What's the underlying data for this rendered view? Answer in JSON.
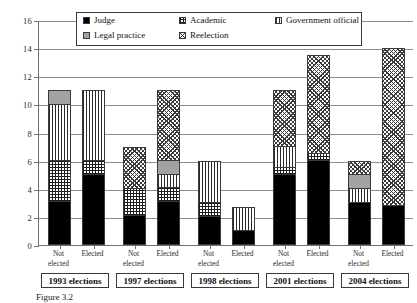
{
  "chart_data": {
    "type": "bar",
    "stacked": true,
    "title": "",
    "xlabel": "",
    "ylabel": "",
    "ylim": [
      0,
      16
    ],
    "ytick_step": 2,
    "yticks": [
      0,
      2,
      4,
      6,
      8,
      10,
      12,
      14,
      16
    ],
    "grid": true,
    "legend_position": "top-center",
    "series": [
      {
        "name": "Judge",
        "pattern": "solid-black",
        "values": [
          3,
          5,
          2,
          3,
          2,
          1,
          5,
          6,
          3,
          2.7
        ]
      },
      {
        "name": "Academic",
        "pattern": "cross-hatch-grid",
        "values": [
          3,
          1,
          2,
          1,
          1,
          0,
          0.5,
          0.5,
          0,
          0
        ]
      },
      {
        "name": "Government official",
        "pattern": "vertical-stripes",
        "values": [
          4,
          5,
          0,
          1,
          3,
          1.7,
          1.5,
          0,
          1,
          0
        ]
      },
      {
        "name": "Legal practice",
        "pattern": "solid-gray",
        "values": [
          1,
          0,
          0,
          1,
          0,
          0,
          0,
          0,
          1,
          0
        ]
      },
      {
        "name": "Reelection",
        "pattern": "diagonal-cross-hatch",
        "values": [
          0,
          0,
          3,
          5,
          0,
          0,
          4,
          7,
          1,
          11.3
        ]
      }
    ],
    "categories": [
      "Not elected",
      "Elected",
      "Not elected",
      "Elected",
      "Not elected",
      "Elected",
      "Not elected",
      "Elected",
      "Not elected",
      "Elected"
    ],
    "totals": [
      11,
      11,
      7,
      11,
      6,
      2.7,
      11,
      13.5,
      6,
      14
    ],
    "groups": [
      {
        "label": "1993 elections",
        "bars": [
          0,
          1
        ]
      },
      {
        "label": "1997 elections",
        "bars": [
          2,
          3
        ]
      },
      {
        "label": "1998 elections",
        "bars": [
          4,
          5
        ]
      },
      {
        "label": "2001 elections",
        "bars": [
          6,
          7
        ]
      },
      {
        "label": "2004 elections",
        "bars": [
          8,
          9
        ]
      }
    ]
  },
  "legend": {
    "items": [
      {
        "label": "Judge",
        "pattern": "solid-black"
      },
      {
        "label": "Academic",
        "pattern": "cross-hatch-grid"
      },
      {
        "label": "Government official",
        "pattern": "vertical-stripes"
      },
      {
        "label": "Legal practice",
        "pattern": "solid-gray"
      },
      {
        "label": "Reelection",
        "pattern": "diagonal-cross-hatch"
      }
    ]
  },
  "axis": {
    "y_labels": [
      "0",
      "2",
      "4",
      "6",
      "8",
      "10",
      "12",
      "14",
      "16"
    ]
  },
  "caption": {
    "text": "Figure 3.2"
  },
  "colors": {
    "judge": "#000000",
    "legal_practice": "#a2a2a2",
    "axis": "#6f6f6f",
    "grid": "#8d8d8d",
    "bar_outline": "#3a3a3a",
    "background": "#ffffff"
  }
}
